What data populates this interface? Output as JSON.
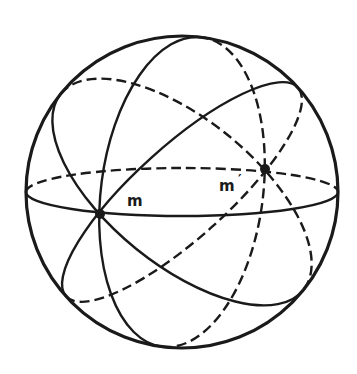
{
  "diagram": {
    "ink_color": "#1a1a1a",
    "background": "#ffffff",
    "sphere": {
      "cx": 182,
      "cy": 192,
      "r": 156,
      "stroke_width": 3.2
    },
    "great_circles": [
      {
        "name": "equator",
        "angle": 0,
        "rx": 156,
        "ry": 24,
        "solid_side": "plus",
        "stroke_width": 2.4
      },
      {
        "name": "circle-near-vertical",
        "angle": -82.6,
        "rx": 156,
        "ry": 81,
        "solid_side": "minus",
        "stroke_width": 2.4
      },
      {
        "name": "circle-descending",
        "angle": 39,
        "rx": 156,
        "ry": 73,
        "solid_side": "plus",
        "stroke_width": 2.4
      },
      {
        "name": "circle-ascending",
        "angle": -42,
        "rx": 156,
        "ry": 46,
        "solid_side": "minus",
        "stroke_width": 2.4
      }
    ],
    "dash_pattern": "10 5",
    "points": [
      {
        "name": "m",
        "x": 100,
        "y": 214,
        "r": 5
      },
      {
        "name": "m-prime",
        "x": 265,
        "y": 169,
        "r": 5
      }
    ],
    "labels": {
      "m": "m",
      "m_prime": "m",
      "prime_mark": "′"
    }
  }
}
